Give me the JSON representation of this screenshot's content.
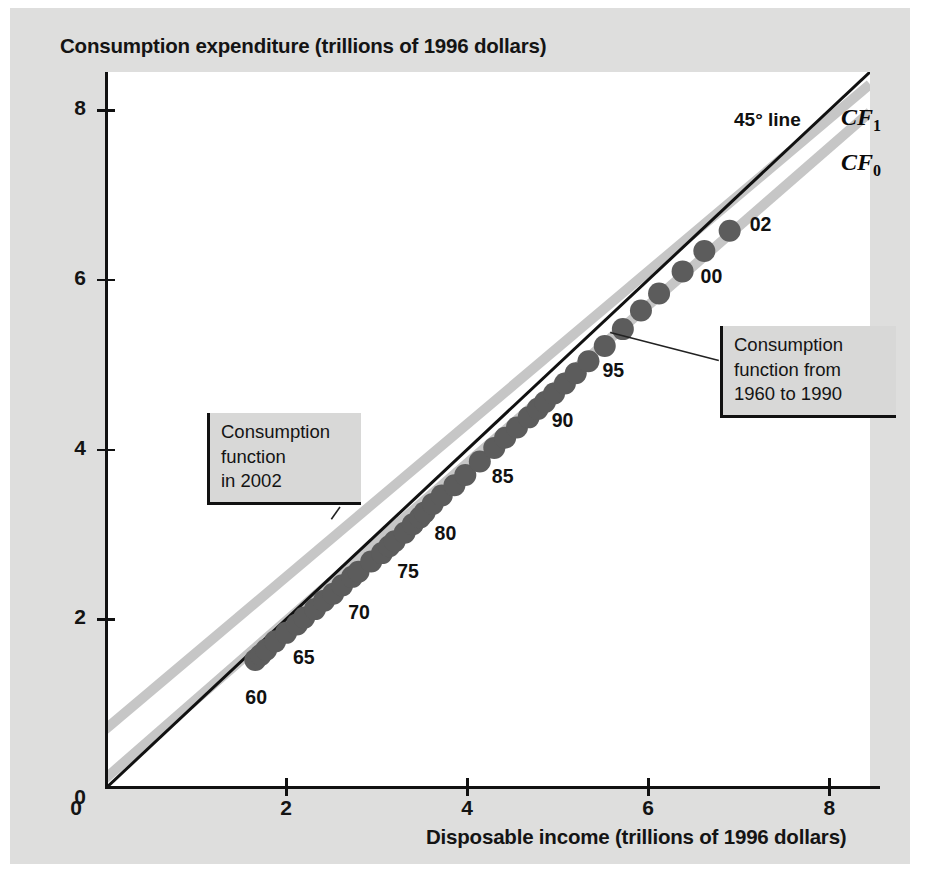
{
  "figure": {
    "background_color": "#dededd",
    "plot_background_color": "#ffffff"
  },
  "chart_data": {
    "type": "scatter",
    "title": "Consumption expenditure (trillions of 1996 dollars)",
    "xlabel": "Disposable income (trillions of 1996 dollars)",
    "ylabel": "Consumption expenditure (trillions of 1996 dollars)",
    "xlim": [
      0,
      8.45
    ],
    "ylim": [
      0,
      8.45
    ],
    "xticks": [
      0,
      2,
      4,
      6,
      8
    ],
    "yticks": [
      0,
      2,
      4,
      6,
      8
    ],
    "xtick_labels": [
      "0",
      "2",
      "4",
      "6",
      "8"
    ],
    "ytick_labels": [
      "0",
      "2",
      "4",
      "6",
      "8"
    ],
    "grid": false,
    "legend": "none",
    "point_color": "#5c5c5c",
    "point_radius_px": 11,
    "series": [
      {
        "name": "Consumption vs disposable income, 1960-2002",
        "x": [
          1.66,
          1.72,
          1.78,
          1.88,
          2.0,
          2.12,
          2.2,
          2.32,
          2.42,
          2.52,
          2.62,
          2.73,
          2.8,
          2.94,
          3.06,
          3.14,
          3.2,
          3.31,
          3.4,
          3.48,
          3.53,
          3.62,
          3.72,
          3.86,
          3.98,
          4.14,
          4.3,
          4.42,
          4.55,
          4.68,
          4.78,
          4.86,
          4.96,
          5.08,
          5.2,
          5.34,
          5.52,
          5.72,
          5.92,
          6.12,
          6.38,
          6.62,
          6.9
        ],
        "y": [
          1.52,
          1.58,
          1.64,
          1.74,
          1.84,
          1.94,
          2.02,
          2.12,
          2.22,
          2.3,
          2.4,
          2.5,
          2.56,
          2.68,
          2.78,
          2.86,
          2.92,
          3.02,
          3.12,
          3.2,
          3.26,
          3.36,
          3.46,
          3.58,
          3.7,
          3.86,
          4.02,
          4.14,
          4.26,
          4.38,
          4.48,
          4.56,
          4.66,
          4.78,
          4.9,
          5.04,
          5.22,
          5.42,
          5.64,
          5.84,
          6.1,
          6.34,
          6.58
        ],
        "labels": [
          "60",
          "",
          "",
          "",
          "",
          "65",
          "",
          "",
          "",
          "",
          "70",
          "",
          "",
          "",
          "",
          "75",
          "",
          "",
          "",
          "",
          "80",
          "",
          "",
          "",
          "",
          "85",
          "",
          "",
          "",
          "",
          "90",
          "",
          "",
          "",
          "",
          "95",
          "",
          "",
          "",
          "",
          "00",
          "",
          "02"
        ]
      }
    ],
    "point_year_labels": [
      {
        "text": "60",
        "x": 1.66,
        "y": 1.52
      },
      {
        "text": "65",
        "x": 2.12,
        "y": 1.94
      },
      {
        "text": "70",
        "x": 2.62,
        "y": 2.4
      },
      {
        "text": "75",
        "x": 3.14,
        "y": 2.86
      },
      {
        "text": "80",
        "x": 3.53,
        "y": 3.26
      },
      {
        "text": "85",
        "x": 4.14,
        "y": 3.86
      },
      {
        "text": "90",
        "x": 4.78,
        "y": 4.48
      },
      {
        "text": "95",
        "x": 5.34,
        "y": 5.04
      },
      {
        "text": "00",
        "x": 6.38,
        "y": 6.1
      },
      {
        "text": "02",
        "x": 6.9,
        "y": 6.58
      }
    ],
    "reference_lines": [
      {
        "name": "45-degree line",
        "label": "45° line",
        "color": "#111111",
        "width_px": 3,
        "intercept": 0.0,
        "slope": 1.0
      },
      {
        "name": "consumption function 2002",
        "label": "CF",
        "label_sub": "1",
        "color": "#c6c6c6",
        "width_px": 10,
        "intercept": 0.7,
        "slope": 0.9
      },
      {
        "name": "consumption function 1960 to 1990",
        "label": "CF",
        "label_sub": "0",
        "color": "#c6c6c6",
        "width_px": 10,
        "intercept": 0.12,
        "slope": 0.93
      }
    ],
    "annotations": [
      {
        "name": "consumption-function-2002",
        "text": "Consumption\nfunction\nin 2002",
        "target_x": 2.32,
        "target_y": 2.78
      },
      {
        "name": "consumption-function-1960-1990",
        "text": "Consumption\nfunction from\n1960 to 1990",
        "target_x": 5.55,
        "target_y": 5.42
      }
    ]
  },
  "labels": {
    "line45": "45° line",
    "cf1_base": "CF",
    "cf1_sub": "1",
    "cf0_base": "CF",
    "cf0_sub": "0"
  }
}
